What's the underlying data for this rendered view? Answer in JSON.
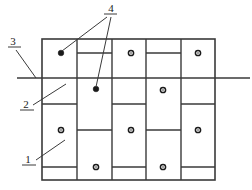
{
  "figure": {
    "background_color": "#ffffff",
    "line_color": "#3a3a3a",
    "marker_color": "#1a1a1a",
    "width": 252,
    "height": 190
  },
  "grid": {
    "left": 42,
    "right": 215,
    "top": 39,
    "bottom": 180,
    "column_count": 5,
    "column_edges": [
      42,
      77,
      112,
      146,
      181,
      215
    ],
    "outer_border_width": 1.6,
    "inner_line_width": 1.4
  },
  "joints": [
    {
      "name": "joint-col2-upper",
      "column": 2,
      "x1": 77,
      "x2": 112,
      "y": 53
    },
    {
      "name": "joint-col4-upper",
      "column": 4,
      "x1": 146,
      "x2": 181,
      "y": 53
    },
    {
      "name": "joint-col1-mid",
      "column": 1,
      "x1": 42,
      "x2": 77,
      "y": 104
    },
    {
      "name": "joint-col3-mid",
      "column": 3,
      "x1": 112,
      "x2": 146,
      "y": 104
    },
    {
      "name": "joint-col5-mid",
      "column": 5,
      "x1": 181,
      "x2": 215,
      "y": 104
    },
    {
      "name": "joint-col2-lower",
      "column": 2,
      "x1": 77,
      "x2": 112,
      "y": 130
    },
    {
      "name": "joint-col4-lower",
      "column": 4,
      "x1": 146,
      "x2": 181,
      "y": 130
    },
    {
      "name": "joint-col1-bottom",
      "column": 1,
      "x1": 42,
      "x2": 77,
      "y": 167
    },
    {
      "name": "joint-col3-bottom",
      "column": 3,
      "x1": 112,
      "x2": 146,
      "y": 167
    },
    {
      "name": "joint-col5-bottom",
      "column": 5,
      "x1": 181,
      "x2": 215,
      "y": 167
    }
  ],
  "through_line": {
    "name": "level-line",
    "x1": 17,
    "x2": 250,
    "y": 78,
    "width": 1.5
  },
  "tie_markers": [
    {
      "name": "tie-point-c3-upper",
      "x": 131,
      "y": 53,
      "style": "hollow"
    },
    {
      "name": "tie-point-c5-upper",
      "x": 198,
      "y": 53,
      "style": "hollow"
    },
    {
      "name": "tie-point-c4-mid",
      "x": 163,
      "y": 90,
      "style": "hollow"
    },
    {
      "name": "tie-point-c1-lower",
      "x": 61,
      "y": 130,
      "style": "hollow"
    },
    {
      "name": "tie-point-c3-lower",
      "x": 131,
      "y": 130,
      "style": "hollow"
    },
    {
      "name": "tie-point-c5-lower",
      "x": 198,
      "y": 130,
      "style": "hollow"
    },
    {
      "name": "tie-point-c2-bottom",
      "x": 96,
      "y": 167,
      "style": "hollow"
    },
    {
      "name": "tie-point-c4-bottom",
      "x": 163,
      "y": 167,
      "style": "hollow"
    },
    {
      "name": "anchor-point-c1-upper",
      "x": 61,
      "y": 53,
      "style": "filled"
    },
    {
      "name": "anchor-point-c2-mid",
      "x": 96,
      "y": 89,
      "style": "filled"
    }
  ],
  "callouts": [
    {
      "id": "callout-4",
      "label": "4",
      "text_x": 111,
      "text_y": 12,
      "underline": {
        "x1": 104,
        "x2": 117,
        "y": 14
      },
      "leaders": [
        {
          "name": "leader-4-a",
          "x1": 107,
          "y1": 17,
          "x2": 62,
          "y2": 51
        },
        {
          "name": "leader-4-b",
          "x1": 111,
          "y1": 17,
          "x2": 96,
          "y2": 87
        }
      ]
    },
    {
      "id": "callout-3",
      "label": "3",
      "text_x": 13,
      "text_y": 45,
      "underline": {
        "x1": 8,
        "x2": 21,
        "y": 47
      },
      "leaders": [
        {
          "name": "leader-3",
          "x1": 16,
          "y1": 50,
          "x2": 36,
          "y2": 78
        }
      ]
    },
    {
      "id": "callout-2",
      "label": "2",
      "text_x": 26,
      "text_y": 108,
      "underline": {
        "x1": 20,
        "x2": 34,
        "y": 110
      },
      "leaders": [
        {
          "name": "leader-2",
          "x1": 33,
          "y1": 105,
          "x2": 66,
          "y2": 84
        }
      ]
    },
    {
      "id": "callout-1",
      "label": "1",
      "text_x": 28,
      "text_y": 163,
      "underline": {
        "x1": 22,
        "x2": 36,
        "y": 165
      },
      "leaders": [
        {
          "name": "leader-1",
          "x1": 36,
          "y1": 160,
          "x2": 65,
          "y2": 140
        }
      ]
    }
  ],
  "caption": {
    "text": "",
    "visible": false
  }
}
